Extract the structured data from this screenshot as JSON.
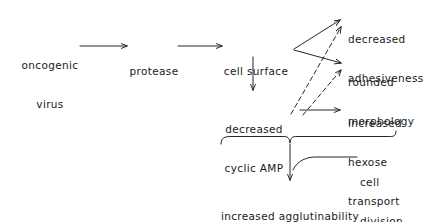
{
  "diagram": {
    "type": "flow-diagram",
    "line_color": "#1a1a1a",
    "background_color": "#ffffff",
    "nodes": [
      {
        "id": "oncogenic-virus",
        "label": "oncogenic\nvirus"
      },
      {
        "id": "protease",
        "label": "protease"
      },
      {
        "id": "cell-surface",
        "label": "cell surface"
      },
      {
        "id": "decreased-adhesiveness",
        "label": "decreased\nadhesiveness"
      },
      {
        "id": "rounded-morphology",
        "label": "rounded\nmorphology"
      },
      {
        "id": "decreased-cyclic-amp",
        "label": "decreased\ncyclic AMP"
      },
      {
        "id": "increased-hexose-transport",
        "label": "increased\nhexose\ntransport"
      },
      {
        "id": "cell-division",
        "label": "cell\ndivision"
      },
      {
        "id": "increased-agglutinability",
        "label": "increased agglutinability\nby plant lectins"
      }
    ],
    "edges": [
      {
        "from": "oncogenic-virus",
        "to": "protease",
        "style": "solid"
      },
      {
        "from": "protease",
        "to": "cell-surface",
        "style": "solid"
      },
      {
        "from": "cell-surface",
        "to": "decreased-adhesiveness",
        "style": "solid"
      },
      {
        "from": "cell-surface",
        "to": "rounded-morphology",
        "style": "solid"
      },
      {
        "from": "cell-surface",
        "to": "decreased-cyclic-amp",
        "style": "solid"
      },
      {
        "from": "decreased-cyclic-amp",
        "to": "increased-hexose-transport",
        "style": "solid"
      },
      {
        "from": "decreased-cyclic-amp",
        "to": "decreased-adhesiveness",
        "style": "dashed"
      },
      {
        "from": "decreased-cyclic-amp",
        "to": "rounded-morphology",
        "style": "dashed"
      },
      {
        "from": "grouped-outcomes",
        "to": "increased-agglutinability",
        "style": "solid"
      },
      {
        "from": "cell-division",
        "to": "agglutinability-arrow",
        "style": "solid"
      }
    ]
  },
  "labels": {
    "oncogenic_virus_line1": "oncogenic",
    "oncogenic_virus_line2": "virus",
    "protease": "protease",
    "cell_surface": "cell surface",
    "decreased_adhesiveness_line1": "decreased",
    "decreased_adhesiveness_line2": "adhesiveness",
    "rounded_morphology_line1": "rounded",
    "rounded_morphology_line2": "morphology",
    "decreased_cyclic_amp_line1": "decreased",
    "decreased_cyclic_amp_line2": "cyclic AMP",
    "increased_hexose_line1": "increased",
    "increased_hexose_line2": "hexose",
    "increased_hexose_line3": "transport",
    "cell_division_line1": "cell",
    "cell_division_line2": "division",
    "agglutinability_line1": "increased agglutinability",
    "agglutinability_line2": "by plant lectins"
  }
}
